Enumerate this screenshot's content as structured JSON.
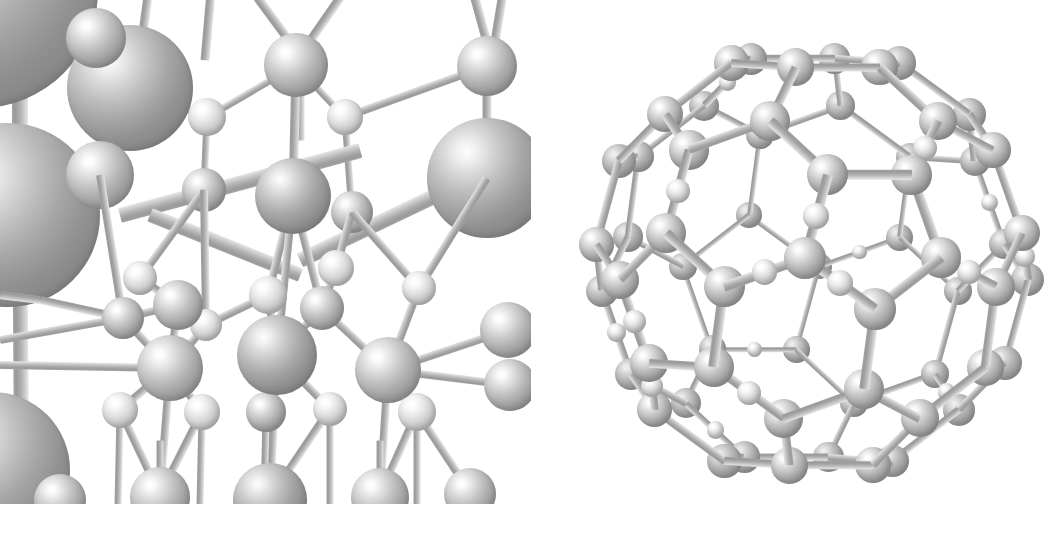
{
  "figure": {
    "background_color": "#ffffff",
    "width": 1059,
    "height": 533,
    "style": "ball-and-stick, grayscale shaded spheres",
    "panel_count": 2
  },
  "panels": [
    {
      "id": "lattice",
      "name": "periodic-lattice-panel",
      "caption": "",
      "description": "Cut-away view of a periodic tetrahedrally bonded crystal lattice with large foreground atoms and smaller bridging atoms; clipped at the frame edges.",
      "bounds": {
        "x": 0,
        "y": 0,
        "width": 531,
        "height": 504
      },
      "atom_species": [
        {
          "label": "large-atom",
          "radius_px": 38,
          "shade": "deep"
        },
        {
          "label": "medium-atom",
          "radius_px": 24,
          "shade": "default"
        },
        {
          "label": "small-atom",
          "radius_px": 14,
          "shade": "pale"
        }
      ]
    },
    {
      "id": "cage",
      "name": "fullerene-cage-panel",
      "caption": "",
      "description": "Closed fullerene-like cage cluster built from large vertex atoms joined by bonds, with smaller atoms capping edges; viewed as a near-spherical polyhedron.",
      "bounds": {
        "x": 560,
        "y": 0,
        "width": 499,
        "height": 533
      },
      "atom_species": [
        {
          "label": "cage-vertex-atom",
          "radius_px": 19,
          "shade": "default"
        },
        {
          "label": "cage-cap-atom",
          "radius_px": 11,
          "shade": "pale"
        }
      ]
    }
  ],
  "colors": {
    "background": "#ffffff",
    "sphere_highlight": "#ffffff",
    "sphere_midtone": "#b0b0b0",
    "sphere_shadow": "#868686",
    "bond_light": "#e6e6e6",
    "bond_dark": "#9a9a9a"
  },
  "chart_data": {
    "type": "scatter",
    "xlabel": "",
    "ylabel": "",
    "lattice": {
      "atoms": [
        {
          "x": -20,
          "y": -10,
          "r": 118,
          "c": "deep"
        },
        {
          "x": 8,
          "y": 210,
          "r": 92,
          "c": "deep"
        },
        {
          "x": -8,
          "y": 470,
          "r": 78,
          "c": "deep"
        },
        {
          "x": 130,
          "y": 88,
          "r": 63,
          "c": "deep"
        },
        {
          "x": 100,
          "y": 175,
          "r": 34,
          "c": "default"
        },
        {
          "x": 96,
          "y": 38,
          "r": 30,
          "c": "default"
        },
        {
          "x": 296,
          "y": 65,
          "r": 32,
          "c": "default"
        },
        {
          "x": 293,
          "y": 196,
          "r": 38,
          "c": "deep"
        },
        {
          "x": 487,
          "y": 66,
          "r": 30,
          "c": "default"
        },
        {
          "x": 487,
          "y": 178,
          "r": 60,
          "c": "deep"
        },
        {
          "x": 207,
          "y": 117,
          "r": 19,
          "c": "pale"
        },
        {
          "x": 345,
          "y": 117,
          "r": 18,
          "c": "pale"
        },
        {
          "x": 204,
          "y": 190,
          "r": 22,
          "c": "default"
        },
        {
          "x": 352,
          "y": 212,
          "r": 21,
          "c": "default"
        },
        {
          "x": 123,
          "y": 318,
          "r": 21,
          "c": "default"
        },
        {
          "x": 178,
          "y": 305,
          "r": 25,
          "c": "default"
        },
        {
          "x": 268,
          "y": 295,
          "r": 19,
          "c": "pale"
        },
        {
          "x": 322,
          "y": 308,
          "r": 22,
          "c": "default"
        },
        {
          "x": 170,
          "y": 368,
          "r": 33,
          "c": "default"
        },
        {
          "x": 277,
          "y": 355,
          "r": 40,
          "c": "deep"
        },
        {
          "x": 388,
          "y": 370,
          "r": 33,
          "c": "default"
        },
        {
          "x": 140,
          "y": 278,
          "r": 17,
          "c": "pale"
        },
        {
          "x": 206,
          "y": 325,
          "r": 16,
          "c": "pale"
        },
        {
          "x": 336,
          "y": 268,
          "r": 18,
          "c": "pale"
        },
        {
          "x": 419,
          "y": 288,
          "r": 17,
          "c": "pale"
        },
        {
          "x": 120,
          "y": 410,
          "r": 18,
          "c": "pale"
        },
        {
          "x": 202,
          "y": 412,
          "r": 18,
          "c": "pale"
        },
        {
          "x": 266,
          "y": 412,
          "r": 20,
          "c": "default"
        },
        {
          "x": 330,
          "y": 409,
          "r": 17,
          "c": "pale"
        },
        {
          "x": 417,
          "y": 412,
          "r": 19,
          "c": "pale"
        },
        {
          "x": 160,
          "y": 495,
          "r": 30,
          "c": "default"
        },
        {
          "x": 270,
          "y": 498,
          "r": 37,
          "c": "deep"
        },
        {
          "x": 380,
          "y": 495,
          "r": 29,
          "c": "default"
        },
        {
          "x": 470,
          "y": 492,
          "r": 26,
          "c": "default"
        },
        {
          "x": 508,
          "y": 330,
          "r": 28,
          "c": "default"
        },
        {
          "x": 510,
          "y": 385,
          "r": 26,
          "c": "default"
        }
      ],
      "bond_count": 58
    },
    "cage": {
      "center": [
        812,
        262
      ],
      "radius_px": 228,
      "vertex_atom_count": 44,
      "cap_atom_count": 16,
      "bond_count": 86
    }
  }
}
